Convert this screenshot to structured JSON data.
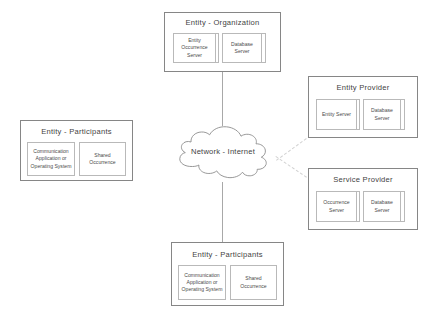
{
  "diagram": {
    "cloud": {
      "label": "Network - Internet"
    },
    "nodes": [
      {
        "id": "entity-organization",
        "title": "Entity - Organization",
        "servers": [
          {
            "label": "Entity Occurrence Server",
            "stacked": true
          },
          {
            "label": "Database Server",
            "stacked": true
          }
        ]
      },
      {
        "id": "entity-provider",
        "title": "Entity Provider",
        "servers": [
          {
            "label": "Entity Server",
            "stacked": true
          },
          {
            "label": "Database Server",
            "stacked": true
          }
        ]
      },
      {
        "id": "service-provider",
        "title": "Service Provider",
        "servers": [
          {
            "label": "Occurrence Server",
            "stacked": true
          },
          {
            "label": "Database Server",
            "stacked": true
          }
        ]
      },
      {
        "id": "entity-participants-left",
        "title": "Entity - Participants",
        "servers": [
          {
            "label": "Communication Application or Operating System",
            "stacked": false
          },
          {
            "label": "Shared Occurrence",
            "stacked": false
          }
        ]
      },
      {
        "id": "entity-participants-bottom",
        "title": "Entity - Participants",
        "servers": [
          {
            "label": "Communication Application or Operating System",
            "stacked": false
          },
          {
            "label": "Shared Occurrence",
            "stacked": false
          }
        ]
      }
    ],
    "colors": {
      "node_border": "#868686",
      "inner_border": "#b9b9b9",
      "text": "#3f3f3f",
      "connector_solid": "#a8a8a8",
      "connector_dashed": "#d2d2d2",
      "background": "#ffffff"
    }
  }
}
